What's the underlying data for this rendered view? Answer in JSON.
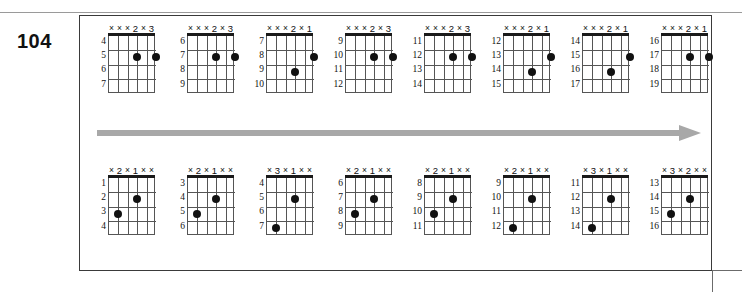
{
  "page": {
    "figure_number": "104",
    "accent_color": "#a8a8a8",
    "dot_color": "#111111",
    "line_color": "#555555"
  },
  "rows": [
    {
      "name": "row-1",
      "arrow": "right-arrow",
      "chords": [
        {
          "fingering": [
            "×",
            "×",
            "×",
            "2",
            "×",
            "3"
          ],
          "frets": [
            "4",
            "5",
            "6",
            "7"
          ],
          "dots": [
            {
              "string": 4,
              "fret": 2
            },
            {
              "string": 6,
              "fret": 2
            }
          ]
        },
        {
          "fingering": [
            "×",
            "×",
            "×",
            "2",
            "×",
            "3"
          ],
          "frets": [
            "6",
            "7",
            "8",
            "9"
          ],
          "dots": [
            {
              "string": 4,
              "fret": 2
            },
            {
              "string": 6,
              "fret": 2
            }
          ]
        },
        {
          "fingering": [
            "×",
            "×",
            "×",
            "2",
            "×",
            "1"
          ],
          "frets": [
            "7",
            "8",
            "9",
            "10"
          ],
          "dots": [
            {
              "string": 6,
              "fret": 2
            },
            {
              "string": 4,
              "fret": 3
            }
          ]
        },
        {
          "fingering": [
            "×",
            "×",
            "×",
            "2",
            "×",
            "3"
          ],
          "frets": [
            "9",
            "10",
            "11",
            "12"
          ],
          "dots": [
            {
              "string": 4,
              "fret": 2
            },
            {
              "string": 6,
              "fret": 2
            }
          ]
        },
        {
          "fingering": [
            "×",
            "×",
            "×",
            "2",
            "×",
            "3"
          ],
          "frets": [
            "11",
            "12",
            "13",
            "14"
          ],
          "dots": [
            {
              "string": 4,
              "fret": 2
            },
            {
              "string": 6,
              "fret": 2
            }
          ]
        },
        {
          "fingering": [
            "×",
            "×",
            "×",
            "2",
            "×",
            "1"
          ],
          "frets": [
            "12",
            "13",
            "14",
            "15"
          ],
          "dots": [
            {
              "string": 6,
              "fret": 2
            },
            {
              "string": 4,
              "fret": 3
            }
          ]
        },
        {
          "fingering": [
            "×",
            "×",
            "×",
            "2",
            "×",
            "1"
          ],
          "frets": [
            "14",
            "15",
            "16",
            "17"
          ],
          "dots": [
            {
              "string": 6,
              "fret": 2
            },
            {
              "string": 4,
              "fret": 3
            }
          ]
        },
        {
          "fingering": [
            "×",
            "×",
            "×",
            "2",
            "×",
            "1"
          ],
          "frets": [
            "16",
            "17",
            "18",
            "19"
          ],
          "dots": [
            {
              "string": 4,
              "fret": 2
            },
            {
              "string": 6,
              "fret": 2
            }
          ]
        }
      ]
    },
    {
      "name": "row-2",
      "arrow": "right-arrow",
      "chords": [
        {
          "fingering": [
            "×",
            "2",
            "×",
            "1",
            "×",
            "×"
          ],
          "frets": [
            "1",
            "2",
            "3",
            "4"
          ],
          "dots": [
            {
              "string": 4,
              "fret": 2
            },
            {
              "string": 2,
              "fret": 3
            }
          ]
        },
        {
          "fingering": [
            "×",
            "2",
            "×",
            "1",
            "×",
            "×"
          ],
          "frets": [
            "3",
            "4",
            "5",
            "6"
          ],
          "dots": [
            {
              "string": 4,
              "fret": 2
            },
            {
              "string": 2,
              "fret": 3
            }
          ]
        },
        {
          "fingering": [
            "×",
            "3",
            "×",
            "1",
            "×",
            "×"
          ],
          "frets": [
            "4",
            "5",
            "6",
            "7"
          ],
          "dots": [
            {
              "string": 4,
              "fret": 2
            },
            {
              "string": 2,
              "fret": 4
            }
          ]
        },
        {
          "fingering": [
            "×",
            "2",
            "×",
            "1",
            "×",
            "×"
          ],
          "frets": [
            "6",
            "7",
            "8",
            "9"
          ],
          "dots": [
            {
              "string": 4,
              "fret": 2
            },
            {
              "string": 2,
              "fret": 3
            }
          ]
        },
        {
          "fingering": [
            "×",
            "2",
            "×",
            "1",
            "×",
            "×"
          ],
          "frets": [
            "8",
            "9",
            "10",
            "11"
          ],
          "dots": [
            {
              "string": 4,
              "fret": 2
            },
            {
              "string": 2,
              "fret": 3
            }
          ]
        },
        {
          "fingering": [
            "×",
            "2",
            "×",
            "1",
            "×",
            "×"
          ],
          "frets": [
            "9",
            "10",
            "11",
            "12"
          ],
          "dots": [
            {
              "string": 4,
              "fret": 2
            },
            {
              "string": 2,
              "fret": 4
            }
          ]
        },
        {
          "fingering": [
            "×",
            "3",
            "×",
            "1",
            "×",
            "×"
          ],
          "frets": [
            "11",
            "12",
            "13",
            "14"
          ],
          "dots": [
            {
              "string": 4,
              "fret": 2
            },
            {
              "string": 2,
              "fret": 4
            }
          ]
        },
        {
          "fingering": [
            "×",
            "3",
            "×",
            "2",
            "×",
            "×"
          ],
          "frets": [
            "13",
            "14",
            "15",
            "16"
          ],
          "dots": [
            {
              "string": 4,
              "fret": 2
            },
            {
              "string": 2,
              "fret": 3
            }
          ]
        }
      ]
    }
  ]
}
